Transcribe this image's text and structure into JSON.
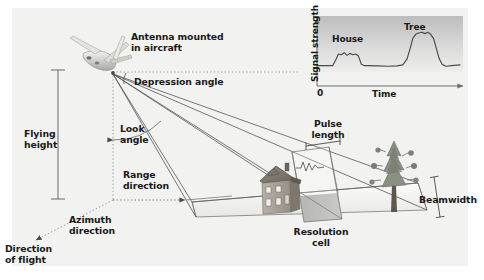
{
  "figure": {
    "name": "side-looking-airborne-radar-geometry",
    "background": "#ffffff",
    "panel_color": "#f2f2f0",
    "ink_color": "#2b2b2b",
    "label_color": "#1a1a1a"
  },
  "labels": {
    "antenna": "Antenna mounted\nin aircraft",
    "antenna_line1": "Antenna mounted",
    "antenna_line2": "in aircraft",
    "depression_angle": "Depression angle",
    "look_angle_line1": "Look",
    "look_angle_line2": "angle",
    "flying_height_line1": "Flying",
    "flying_height_line2": "height",
    "range_direction_line1": "Range",
    "range_direction_line2": "direction",
    "azimuth_direction_line1": "Azimuth",
    "azimuth_direction_line2": "direction",
    "direction_of_flight_line1": "Direction",
    "direction_of_flight_line2": "of flight",
    "pulse_length_line1": "Pulse",
    "pulse_length_line2": "length",
    "resolution_cell_line1": "Resolution",
    "resolution_cell_line2": "cell",
    "beamwidth": "Beamwidth"
  },
  "objects": {
    "aircraft": "aircraft-icon",
    "house": "house-icon",
    "tree": "tree-icon",
    "resolution_cell": "resolution-cell-patch",
    "swath": "radar-beam-footprint"
  },
  "chart_data": {
    "type": "line",
    "title": "",
    "xlabel": "Time",
    "ylabel": "Signal strength",
    "x_origin_label": "0",
    "grid": false,
    "legend": false,
    "annotations": [
      {
        "label": "House",
        "x": 0.2,
        "y": 0.46
      },
      {
        "label": "Tree",
        "x": 0.65,
        "y": 0.8
      }
    ],
    "xlim": [
      0,
      1
    ],
    "ylim": [
      0,
      1
    ],
    "series": [
      {
        "name": "Return signal strength",
        "x": [
          0.0,
          0.06,
          0.11,
          0.13,
          0.15,
          0.17,
          0.19,
          0.21,
          0.23,
          0.25,
          0.27,
          0.29,
          0.31,
          0.33,
          0.36,
          0.42,
          0.5,
          0.56,
          0.6,
          0.63,
          0.655,
          0.67,
          0.69,
          0.71,
          0.735,
          0.755,
          0.775,
          0.795,
          0.815,
          0.835,
          0.855,
          0.875,
          0.9,
          0.94,
          1.0
        ],
        "y": [
          0.3,
          0.3,
          0.3,
          0.38,
          0.47,
          0.46,
          0.49,
          0.45,
          0.48,
          0.46,
          0.47,
          0.44,
          0.32,
          0.3,
          0.3,
          0.295,
          0.29,
          0.295,
          0.31,
          0.4,
          0.58,
          0.7,
          0.76,
          0.78,
          0.79,
          0.77,
          0.79,
          0.76,
          0.7,
          0.55,
          0.4,
          0.32,
          0.29,
          0.3,
          0.31
        ]
      }
    ]
  }
}
